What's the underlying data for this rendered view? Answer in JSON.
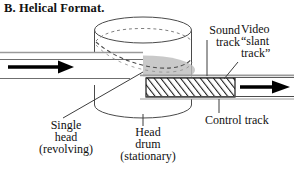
{
  "figure": {
    "title": "B. Helical Format."
  },
  "labels": {
    "sound_track": "Sound\ntrack",
    "video_slant_track": "Video\n“slant\ntrack”",
    "control_track": "Control track",
    "single_head": "Single\nhead\n(revolving)",
    "head_drum": "Head\ndrum\n(stationary)"
  },
  "colors": {
    "ink": "#111111",
    "outline": "#3a3a3a",
    "tape_fill": "#ffffff",
    "tape_edge": "#8a8a8a",
    "shadow_gray": "#b9b9b9",
    "hatch": "#1a1a1a",
    "paper": "#ffffff"
  },
  "elements": {
    "head_drum_shape": "cylinder",
    "helix_path": "dashed-helical-wrap",
    "tape_in_arrow": "arrow-right",
    "tape_out_arrow": "arrow-right",
    "slant_track_hatching": "diagonal-stripes"
  }
}
